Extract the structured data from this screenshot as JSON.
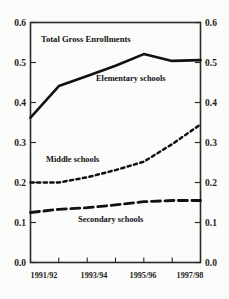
{
  "chart_data": {
    "type": "line",
    "title": "Total Gross Enrollments",
    "xlabel": "",
    "ylabel": "",
    "ylim": [
      0.0,
      0.6
    ],
    "ytick_labels": [
      "0.6",
      "0.5",
      "0.4",
      "0.3",
      "0.2",
      "0.1",
      "0.0"
    ],
    "ytick_values": [
      0.6,
      0.5,
      0.4,
      0.3,
      0.2,
      0.1,
      0.0
    ],
    "right_axis_labels": [
      "0.6",
      "0.5",
      "0.4",
      "0.3",
      "0.2",
      "0.1",
      "0.0"
    ],
    "grid": false,
    "legend_position": "inline-annotations",
    "x": [
      "1991/92",
      "1992/93",
      "1993/94",
      "1994/95",
      "1995/96",
      "1996/97",
      "1997/98"
    ],
    "xtick_labels": [
      "1991/92",
      "1993/94",
      "1995/96",
      "1997/98"
    ],
    "series": [
      {
        "name": "Elementary schools",
        "style": "solid",
        "values": [
          0.362,
          0.441,
          0.466,
          0.492,
          0.521,
          0.504,
          0.506
        ]
      },
      {
        "name": "Middle schools",
        "style": "dotted",
        "values": [
          0.2,
          0.2,
          0.213,
          0.231,
          0.252,
          0.296,
          0.345
        ]
      },
      {
        "name": "Secondary schools",
        "style": "dashed",
        "values": [
          0.125,
          0.133,
          0.137,
          0.144,
          0.152,
          0.155,
          0.155
        ]
      }
    ],
    "annotations": [
      {
        "name": "chart-title",
        "text": "Total Gross Enrollments"
      },
      {
        "name": "elementary-label",
        "text": "Elementary schools"
      },
      {
        "name": "middle-label",
        "text": "Middle schools"
      },
      {
        "name": "secondary-label",
        "text": "Secondary schools"
      }
    ],
    "colors": {
      "line": "#111111",
      "axis": "#2a2a2a",
      "background": "#fdfdfc",
      "text": "#121212"
    }
  }
}
